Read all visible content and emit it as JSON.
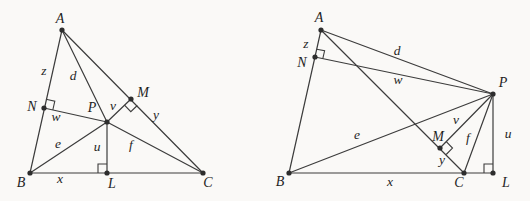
{
  "canvas": {
    "width": 530,
    "height": 201,
    "background": "#faf9f7",
    "line_color": "#3c3c3c",
    "dot_color": "#2d2d2d",
    "label_color": "#1f1f1f",
    "line_width": 1.2,
    "dot_radius": 2.6
  },
  "figures": [
    {
      "id": "left-acute-triangle-figure",
      "description": "triangle-with-interior-point-P-and-perpendicular-feet",
      "points": [
        {
          "id": "A",
          "x": 62,
          "y": 30,
          "label": "A",
          "lx": 60,
          "ly": 20
        },
        {
          "id": "B",
          "x": 30,
          "y": 173,
          "label": "B",
          "lx": 21,
          "ly": 184
        },
        {
          "id": "C",
          "x": 203,
          "y": 173,
          "label": "C",
          "lx": 208,
          "ly": 184
        },
        {
          "id": "L",
          "x": 107,
          "y": 173,
          "label": "L",
          "lx": 112,
          "ly": 185
        },
        {
          "id": "M",
          "x": 131,
          "y": 99,
          "label": "M",
          "lx": 143,
          "ly": 94
        },
        {
          "id": "N",
          "x": 44,
          "y": 108,
          "label": "N",
          "lx": 32,
          "ly": 108
        },
        {
          "id": "P",
          "x": 107,
          "y": 122,
          "label": "P",
          "lx": 92,
          "ly": 109
        }
      ],
      "segments": [
        [
          "A",
          "B"
        ],
        [
          "B",
          "C"
        ],
        [
          "C",
          "A"
        ],
        [
          "A",
          "P"
        ],
        [
          "B",
          "P"
        ],
        [
          "C",
          "P"
        ],
        [
          "P",
          "N"
        ],
        [
          "P",
          "M"
        ],
        [
          "P",
          "L"
        ]
      ],
      "segment_labels": [
        {
          "text": "z",
          "x": 44,
          "y": 72
        },
        {
          "text": "d",
          "x": 73,
          "y": 77
        },
        {
          "text": "w",
          "x": 56,
          "y": 118
        },
        {
          "text": "v",
          "x": 113,
          "y": 107
        },
        {
          "text": "y",
          "x": 156,
          "y": 116
        },
        {
          "text": "e",
          "x": 58,
          "y": 145
        },
        {
          "text": "u",
          "x": 97,
          "y": 148
        },
        {
          "text": "f",
          "x": 131,
          "y": 146
        },
        {
          "text": "x",
          "x": 60,
          "y": 180
        }
      ],
      "right_angles": [
        {
          "at": "N",
          "toward1": "A",
          "toward2": "P",
          "size": 9
        },
        {
          "at": "M",
          "toward1": "C",
          "toward2": "P",
          "size": 9
        },
        {
          "at": "L",
          "toward1": "B",
          "toward2": "P",
          "size": 9
        }
      ]
    },
    {
      "id": "right-obtuse-triangle-figure",
      "description": "triangle-with-exterior-point-P-and-perpendicular-feet",
      "points": [
        {
          "id": "A",
          "x": 321,
          "y": 30,
          "label": "A",
          "lx": 319,
          "ly": 19
        },
        {
          "id": "B",
          "x": 289,
          "y": 173,
          "label": "B",
          "lx": 280,
          "ly": 183
        },
        {
          "id": "C",
          "x": 464,
          "y": 173,
          "label": "C",
          "lx": 459,
          "ly": 184
        },
        {
          "id": "L",
          "x": 493,
          "y": 173,
          "label": "L",
          "lx": 506,
          "ly": 184
        },
        {
          "id": "M",
          "x": 440,
          "y": 148,
          "label": "M",
          "lx": 438,
          "ly": 138
        },
        {
          "id": "N",
          "x": 315,
          "y": 57,
          "label": "N",
          "lx": 302,
          "ly": 64
        },
        {
          "id": "P",
          "x": 493,
          "y": 94,
          "label": "P",
          "lx": 503,
          "ly": 84
        }
      ],
      "segments": [
        [
          "A",
          "B"
        ],
        [
          "B",
          "L"
        ],
        [
          "C",
          "A"
        ],
        [
          "A",
          "P"
        ],
        [
          "B",
          "P"
        ],
        [
          "C",
          "P"
        ],
        [
          "P",
          "N"
        ],
        [
          "P",
          "M"
        ],
        [
          "P",
          "L"
        ]
      ],
      "segment_labels": [
        {
          "text": "z",
          "x": 306,
          "y": 45
        },
        {
          "text": "d",
          "x": 397,
          "y": 52
        },
        {
          "text": "w",
          "x": 398,
          "y": 81
        },
        {
          "text": "e",
          "x": 357,
          "y": 136
        },
        {
          "text": "v",
          "x": 456,
          "y": 121
        },
        {
          "text": "f",
          "x": 468,
          "y": 139
        },
        {
          "text": "u",
          "x": 508,
          "y": 135
        },
        {
          "text": "y",
          "x": 442,
          "y": 161
        },
        {
          "text": "x",
          "x": 390,
          "y": 183
        }
      ],
      "right_angles": [
        {
          "at": "N",
          "toward1": "A",
          "toward2": "P",
          "size": 8
        },
        {
          "at": "M",
          "toward1": "C",
          "toward2": "P",
          "size": 9
        },
        {
          "at": "L",
          "toward1": "B",
          "toward2": "P",
          "size": 9
        }
      ]
    }
  ]
}
